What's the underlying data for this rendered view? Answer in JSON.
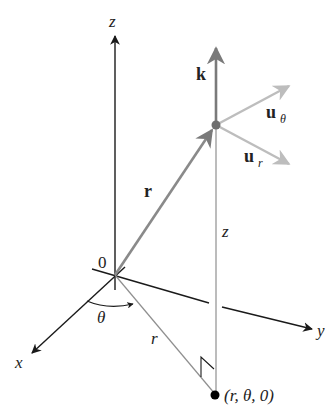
{
  "diagram": {
    "axes": {
      "z_label": "z",
      "x_label": "x",
      "y_label": "y",
      "origin_label": "0"
    },
    "vectors": {
      "position": {
        "label": "r"
      },
      "k": {
        "label": "k"
      },
      "u_theta": {
        "label": "u",
        "subscript": "θ"
      },
      "u_r": {
        "label": "u",
        "subscript": "r"
      }
    },
    "segments": {
      "radial_projection_label": "r",
      "height_label": "z",
      "angle_label": "θ"
    },
    "points": {
      "base_point_label": "(r, θ, 0)"
    },
    "colors": {
      "axis": "#1a1a1a",
      "vector_r": "#8a8a8a",
      "vector_k": "#7a7a7a",
      "vector_u": "#bdbdbd",
      "construction": "#8f8f8f",
      "point_P": "#6e6e6e",
      "base_point": "#000000"
    }
  }
}
